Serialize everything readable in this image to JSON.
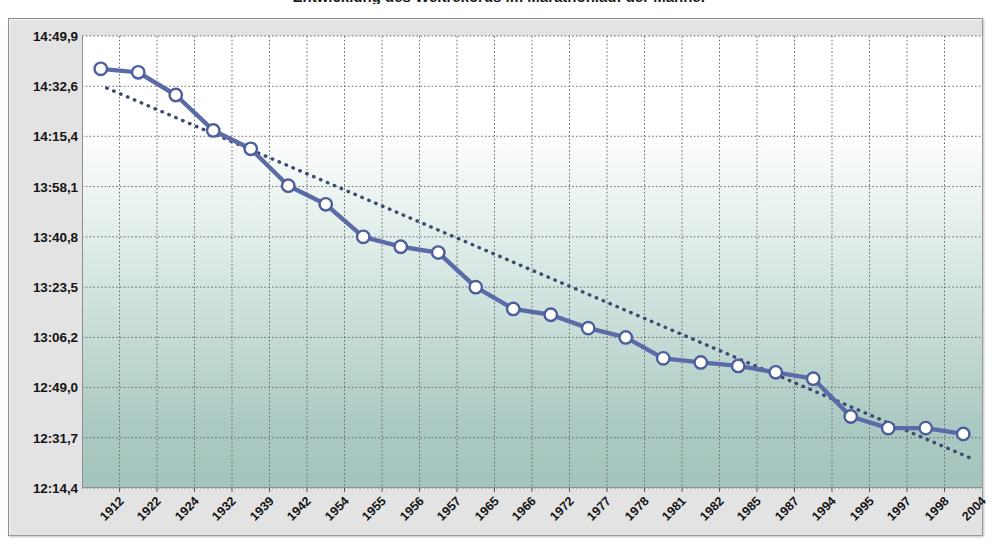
{
  "title": "Entwicklung des Weltrekords im Marathonlauf der Männer",
  "colors": {
    "series_line": "#5a6ba8",
    "marker_fill": "#ffffff",
    "marker_stroke": "#4c5e9c",
    "trend_line": "#3b4a70",
    "grid": "#6b6b6b",
    "plot_top": "#ffffff",
    "plot_bottom": "#a3c4bc",
    "frame_bg": "#e3e3e3",
    "axis": "#8e8e8e",
    "text": "#141414"
  },
  "chart_data": {
    "type": "line",
    "title": "Entwicklung des Weltrekords im Marathonlauf der Männer",
    "xlabel": "",
    "ylabel": "",
    "grid": true,
    "legend": false,
    "ytick_labels": [
      "14:49,9",
      "14:32,6",
      "14:15,4",
      "13:58,1",
      "13:40,8",
      "13:23,5",
      "13:06,2",
      "12:49,0",
      "12:31,7",
      "12:14,4"
    ],
    "ytick_values": [
      889.9,
      872.6,
      855.4,
      838.1,
      820.8,
      803.5,
      786.2,
      769.0,
      751.7,
      734.4
    ],
    "ylim": [
      734.4,
      889.9
    ],
    "categories": [
      "1912",
      "1922",
      "1924",
      "1932",
      "1939",
      "1942",
      "1954",
      "1955",
      "1956",
      "1957",
      "1965",
      "1966",
      "1972",
      "1977",
      "1978",
      "1981",
      "1982",
      "1985",
      "1987",
      "1994",
      "1995",
      "1997",
      "1998",
      "2004"
    ],
    "series": [
      {
        "name": "Weltrekord",
        "style": "solid-with-markers",
        "values": [
          878.6,
          877.4,
          869.6,
          857.4,
          851.1,
          838.4,
          832.0,
          820.8,
          817.4,
          815.4,
          803.5,
          796.0,
          794.0,
          789.4,
          786.2,
          779.0,
          777.6,
          776.4,
          774.2,
          772.0,
          759.0,
          755.0,
          755.0,
          753.0
        ],
        "value_labels": [
          "14:38,6",
          "14:37,4",
          "14:29,6",
          "14:17,4",
          "14:11,1",
          "13:58,4",
          "13:52,0",
          "13:40,8",
          "13:37,4",
          "13:35,4",
          "13:23,5",
          "13:16,0",
          "13:14,0",
          "13:09,4",
          "13:06,2",
          "12:59,0",
          "12:57,6",
          "12:56,4",
          "12:54,2",
          "12:52,0",
          "12:39,0",
          "12:35,0",
          "12:35,0",
          "12:33,0"
        ]
      },
      {
        "name": "Trendlinie",
        "style": "dotted",
        "start_value": 872.0,
        "end_value": 744.0
      }
    ]
  }
}
